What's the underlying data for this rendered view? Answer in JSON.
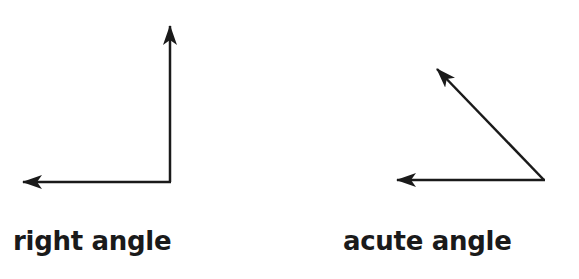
{
  "diagram": {
    "stroke_color": "#1a1a1a",
    "background": "#ffffff",
    "figures": [
      {
        "id": "right-angle",
        "label": "right angle",
        "vertex": [
          170,
          182
        ],
        "rays": [
          {
            "name": "vertical-ray",
            "tip": [
              170,
              25
            ]
          },
          {
            "name": "horizontal-ray",
            "tip": [
              22,
              182
            ]
          }
        ]
      },
      {
        "id": "acute-angle",
        "label": "acute angle",
        "vertex": [
          544,
          180
        ],
        "rays": [
          {
            "name": "diagonal-ray",
            "tip": [
              436,
              68
            ]
          },
          {
            "name": "horizontal-ray",
            "tip": [
              396,
              180
            ]
          }
        ]
      }
    ]
  }
}
